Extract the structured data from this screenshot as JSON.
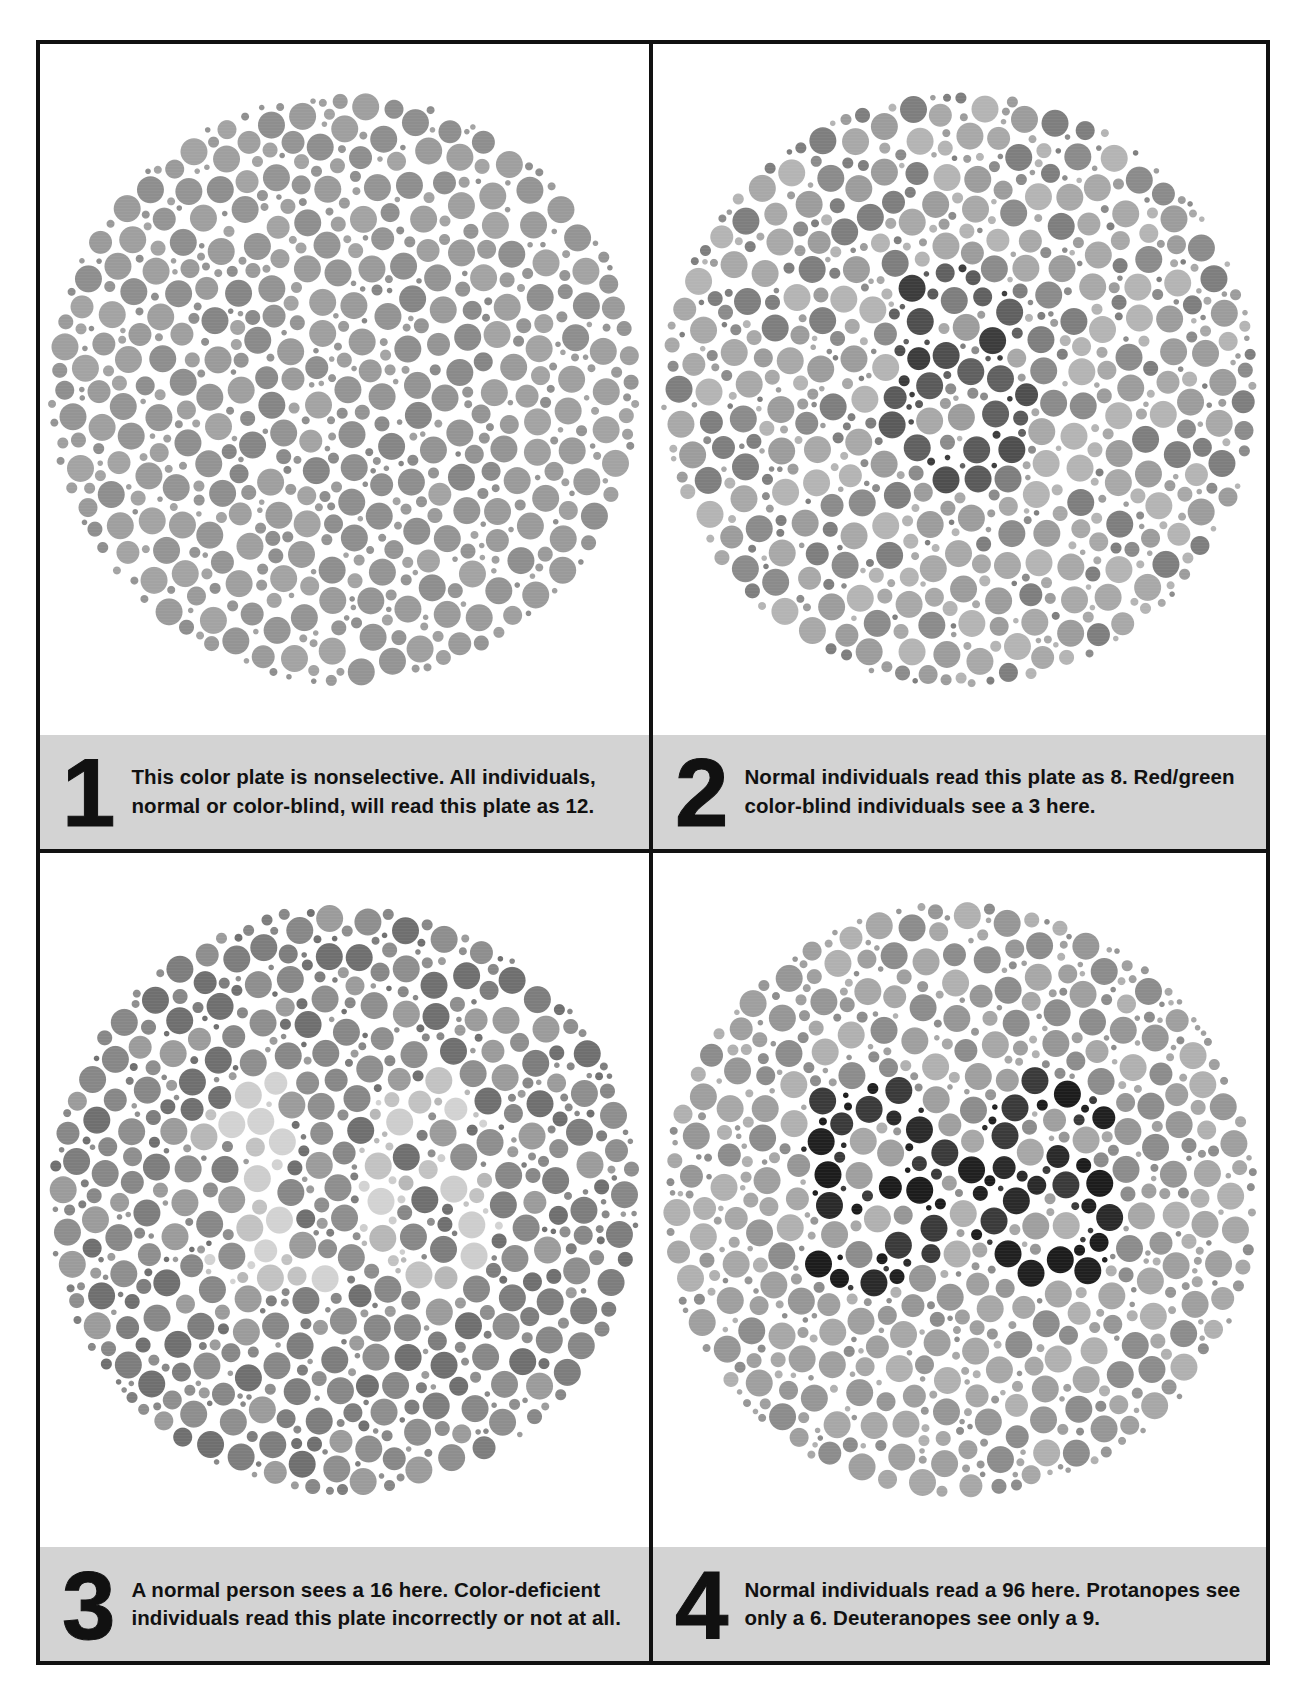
{
  "figure": {
    "kind": "ishihara-color-vision-test-plates",
    "background_color": "#ffffff",
    "frame_color": "#111111",
    "caption_band_color": "#d3d3d3",
    "text_color": "#111111"
  },
  "plates": [
    {
      "number": "1",
      "caption": "This color plate is nonselective. All individuals, normal or color-blind, will read this plate as 12.",
      "hidden_numeral": "12",
      "art": {
        "seed": 11,
        "diameter": 548,
        "figure_numeral": "12",
        "background_dot_colors": [
          "#9a9a9a",
          "#a3a3a3",
          "#949494",
          "#9f9f9f",
          "#8e8e8e"
        ],
        "figure_dot_colors": [
          "#8a8a8a",
          "#939393",
          "#858585"
        ],
        "dot_gap": 2.0
      }
    },
    {
      "number": "2",
      "caption": "Normal individuals read this plate as 8. Red/green color-blind individuals see a 3 here.",
      "hidden_numeral": "8",
      "art": {
        "seed": 22,
        "diameter": 548,
        "figure_numeral": "8",
        "background_dot_colors": [
          "#a8a8a8",
          "#8b8b8b",
          "#b4b4b4",
          "#7e7e7e",
          "#9c9c9c"
        ],
        "figure_dot_colors": [
          "#4e4e4e",
          "#3c3c3c",
          "#606060",
          "#5a5a5a"
        ],
        "dot_gap": 2.0
      }
    },
    {
      "number": "3",
      "caption": "A normal person sees a 16 here. Color-deficient individuals read this plate incorrectly or not at all.",
      "hidden_numeral": "16",
      "art": {
        "seed": 33,
        "diameter": 548,
        "figure_numeral": "16",
        "background_dot_colors": [
          "#8e8e8e",
          "#7d7d7d",
          "#9b9b9b",
          "#6f6f6f",
          "#878787"
        ],
        "figure_dot_colors": [
          "#c2c2c2",
          "#cdcdcd",
          "#b7b7b7",
          "#d2d2d2"
        ],
        "dot_gap": 2.0
      }
    },
    {
      "number": "4",
      "caption": "Normal individuals read a 96 here. Protanopes see only a 6. Deuteranopes see only a 9.",
      "hidden_numeral": "96",
      "art": {
        "seed": 44,
        "diameter": 548,
        "figure_numeral": "96",
        "background_dot_colors": [
          "#9f9f9f",
          "#b0b0b0",
          "#8c8c8c",
          "#a7a7a7",
          "#969696"
        ],
        "figure_dot_colors": [
          "#2a2a2a",
          "#1c1c1c",
          "#3a3a3a",
          "#202020"
        ],
        "dot_gap": 2.0
      }
    }
  ]
}
